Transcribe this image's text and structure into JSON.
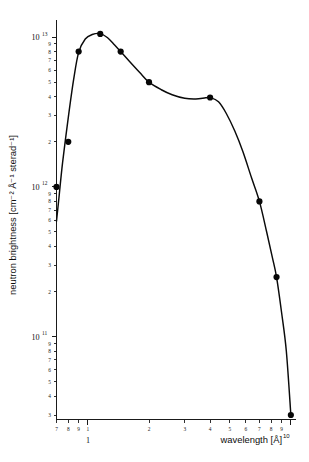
{
  "figure": {
    "background_color": "#ffffff",
    "ink_color": "#111111"
  },
  "chart_data": {
    "type": "line",
    "title": "",
    "subtitle": "",
    "xlabel": "wavelength [Å]",
    "ylabel": "neutron brightness [cm⁻² Å⁻¹ sterad⁻¹]",
    "xscale": "log",
    "yscale": "log",
    "xlim": [
      0.7,
      10.6
    ],
    "ylim": [
      28000000000,
      13000000000000
    ],
    "grid": false,
    "legend": null,
    "legend_position": "none",
    "x_tick_labels": [
      "7",
      "8",
      "9",
      "1",
      "2",
      "3",
      "4",
      "5",
      "6",
      "7",
      "8",
      "9",
      "10"
    ],
    "x_tick_values": [
      0.7,
      0.8,
      0.9,
      1,
      2,
      3,
      4,
      5,
      6,
      7,
      8,
      9,
      10
    ],
    "x_major_labels": [
      "1",
      "10"
    ],
    "y_decade_labels": [
      "10",
      "10",
      "10"
    ],
    "y_decade_exponents": [
      "13",
      "12",
      "11"
    ],
    "y_decade_values": [
      10000000000000,
      1000000000000,
      100000000000
    ],
    "y_minor_labels": [
      "9",
      "8",
      "7",
      "6",
      "5",
      "4",
      "3",
      "2"
    ],
    "y_minor_mantissas": [
      9,
      8,
      7,
      6,
      5,
      4,
      3,
      2
    ],
    "marker_style": "filled-circle",
    "marker_color": "#070707",
    "line_color": "#0a0a0a",
    "series": [
      {
        "name": "neutron brightness",
        "x": [
          0.7,
          0.8,
          0.9,
          1.15,
          1.45,
          2.0,
          4.0,
          7.0,
          8.5,
          10.0
        ],
        "y": [
          1000000000000.0,
          2000000000000.0,
          8000000000000.0,
          10500000000000.0,
          8000000000000.0,
          5000000000000.0,
          3950000000000.0,
          800000000000.0,
          250000000000.0,
          30000000000.0
        ],
        "y_labels": [
          "1.0×10¹²",
          "2.0×10¹²",
          "8.0×10¹²",
          "1.05×10¹³",
          "8.0×10¹²",
          "5.0×10¹²",
          "3.95×10¹²",
          "8.0×10¹¹",
          "2.5×10¹¹",
          "3.0×10¹⁰"
        ]
      }
    ],
    "curve_path_points": [
      [
        0.7,
        590000000000.0
      ],
      [
        0.72,
        850000000000.0
      ],
      [
        0.75,
        1450000000000.0
      ],
      [
        0.8,
        2900000000000.0
      ],
      [
        0.85,
        5200000000000.0
      ],
      [
        0.9,
        7900000000000.0
      ],
      [
        0.97,
        9700000000000.0
      ],
      [
        1.05,
        10400000000000.0
      ],
      [
        1.15,
        10550000000000.0
      ],
      [
        1.25,
        9900000000000.0
      ],
      [
        1.35,
        8900000000000.0
      ],
      [
        1.45,
        8000000000000.0
      ],
      [
        1.6,
        6900000000000.0
      ],
      [
        1.8,
        5800000000000.0
      ],
      [
        2.0,
        5000000000000.0
      ],
      [
        2.3,
        4450000000000.0
      ],
      [
        2.6,
        4120000000000.0
      ],
      [
        3.0,
        3900000000000.0
      ],
      [
        3.4,
        3860000000000.0
      ],
      [
        3.8,
        3930000000000.0
      ],
      [
        4.0,
        3950000000000.0
      ],
      [
        4.4,
        3700000000000.0
      ],
      [
        4.8,
        3100000000000.0
      ],
      [
        5.3,
        2350000000000.0
      ],
      [
        5.8,
        1720000000000.0
      ],
      [
        6.4,
        1150000000000.0
      ],
      [
        7.0,
        800000000000.0
      ],
      [
        7.6,
        500000000000.0
      ],
      [
        8.1,
        340000000000.0
      ],
      [
        8.5,
        250000000000.0
      ],
      [
        9.0,
        145000000000.0
      ],
      [
        9.5,
        80000000000.0
      ],
      [
        10.0,
        30000000000.0
      ]
    ]
  }
}
